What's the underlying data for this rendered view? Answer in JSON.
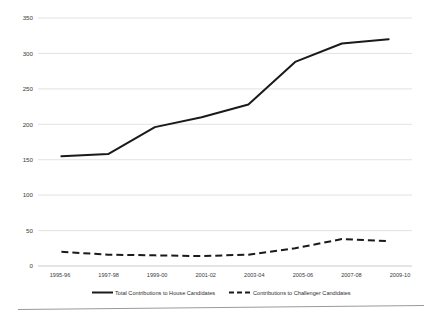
{
  "chart_data": {
    "type": "line",
    "title": "",
    "subtitle": "",
    "xlabel": "",
    "ylabel": "",
    "ylim": [
      0,
      350
    ],
    "ytick_labels": [
      "0",
      "50",
      "100",
      "150",
      "200",
      "250",
      "300",
      "350"
    ],
    "ytick_values": [
      0,
      50,
      100,
      150,
      200,
      250,
      300,
      350
    ],
    "grid": true,
    "legend_position": "bottom",
    "categories": [
      "1995-96",
      "1997-98",
      "1999-00",
      "2001-02",
      "2003-04",
      "2005-06",
      "2007-08",
      "2009-10"
    ],
    "series": [
      {
        "name": "Total Contributions to House Candidates",
        "style": "solid",
        "color": "#1a1a1a",
        "values": [
          155,
          158,
          196,
          210,
          228,
          288,
          314,
          320
        ]
      },
      {
        "name": "Contributions to Challenger Candidates",
        "style": "dashed",
        "color": "#1a1a1a",
        "values": [
          20,
          16,
          15,
          14,
          16,
          25,
          38,
          35
        ]
      }
    ]
  },
  "legend": {
    "entries": [
      {
        "label": "Total Contributions to House Candidates",
        "style": "solid"
      },
      {
        "label": "Contributions to Challenger Candidates",
        "style": "dashed"
      }
    ]
  },
  "axis": {
    "y_labels": [
      "350",
      "300",
      "250",
      "200",
      "150",
      "100",
      "50",
      "0"
    ],
    "x_labels": [
      "1995-96",
      "1997-98",
      "1999-00",
      "2001-02",
      "2003-04",
      "2005-06",
      "2007-08",
      "2009-10"
    ]
  },
  "colors": {
    "series_line": "#1a1a1a",
    "gridline": "#d6d6d6",
    "axis": "#bdbdbd",
    "text": "#3a3a3a",
    "background": "#ffffff"
  }
}
